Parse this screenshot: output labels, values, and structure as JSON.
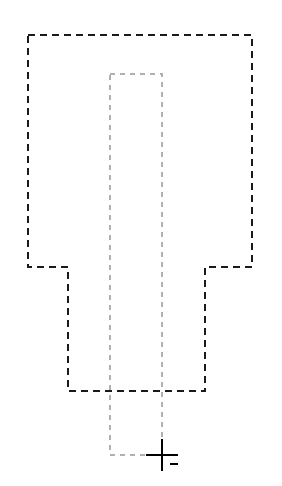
{
  "document": {
    "title": "Dashed Outline Drawing",
    "background_color": "#ffffff",
    "width": 282,
    "height": 486
  },
  "palette": {
    "primary_outline_color": "#1a1a1a",
    "secondary_outline_color": "#b0b0b0",
    "cursor_color": "#000000",
    "background_color": "#ffffff"
  },
  "shapes": {
    "outer_profile": {
      "name": "outer-dashed-profile",
      "color": "#1a1a1a",
      "stroke_width": 2.1,
      "dash_pattern": "7 5",
      "closed": true,
      "points": "28,35 252,35 252,267 205,267 205,391 68,391 68,267 28,267",
      "vertices": [
        {
          "x": 28,
          "y": 35
        },
        {
          "x": 252,
          "y": 35
        },
        {
          "x": 252,
          "y": 267
        },
        {
          "x": 205,
          "y": 267
        },
        {
          "x": 205,
          "y": 391
        },
        {
          "x": 68,
          "y": 391
        },
        {
          "x": 68,
          "y": 267
        },
        {
          "x": 28,
          "y": 267
        }
      ]
    },
    "inner_profile": {
      "name": "inner-dashed-rectangle",
      "color": "#b0b0b0",
      "stroke_width": 1.5,
      "dash_pattern": "5 5",
      "closed": true,
      "points": "110,74 162,74 162,455 110,455",
      "vertices": [
        {
          "x": 110,
          "y": 74
        },
        {
          "x": 162,
          "y": 74
        },
        {
          "x": 162,
          "y": 455
        },
        {
          "x": 110,
          "y": 455
        }
      ]
    }
  },
  "cursor": {
    "name": "crosshair-cursor",
    "color": "#000000",
    "center_x": 162,
    "center_y": 455,
    "arm_length": 16,
    "stroke_width": 2.2,
    "tick": {
      "x1": 170,
      "y1": 464,
      "x2": 178,
      "y2": 464,
      "stroke_width": 2.2
    }
  }
}
